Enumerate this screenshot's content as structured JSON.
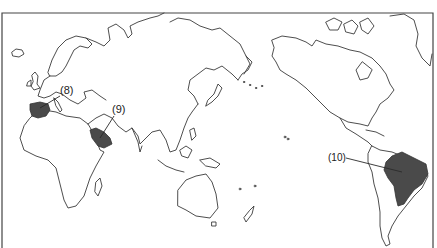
{
  "map": {
    "type": "world outline map (Pacific-centered)",
    "labels": [
      {
        "id": "8",
        "text": "(8)",
        "region": "Iberian Peninsula (Spain/Portugal)",
        "shaded": true
      },
      {
        "id": "9",
        "text": "(9)",
        "region": "Arabian Peninsula (Saudi Arabia)",
        "shaded": true
      },
      {
        "id": "10",
        "text": "(10)",
        "region": "Brazil",
        "shaded": true
      }
    ],
    "colors": {
      "background": "#ffffff",
      "coastline": "#3a3a3a",
      "highlight": "#4a4a4a",
      "frame": "#444444"
    }
  }
}
